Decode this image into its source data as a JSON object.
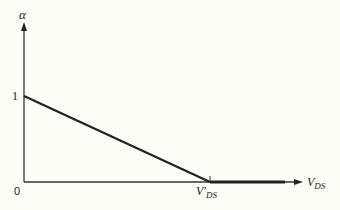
{
  "diagram": {
    "y_axis_label": "α",
    "x_axis_label_main": "V",
    "x_axis_label_sub": "DS",
    "origin_label": "0",
    "y_intercept_label": "1",
    "x_marker_main": "V",
    "x_marker_prime": "′",
    "x_marker_sub": "DS",
    "curve": [
      {
        "x": 0,
        "y": 1
      },
      {
        "x": "V'DS",
        "y": 0
      },
      {
        "x": "beyond",
        "y": 0
      }
    ],
    "colors": {
      "line": "#222222",
      "background": "#fdfdf8"
    }
  }
}
